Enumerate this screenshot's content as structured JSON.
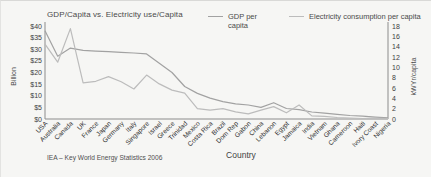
{
  "title": "GDP/Capita vs. Electricity use/Capita",
  "legend": {
    "gdp_label": "GDP per capita",
    "electricity_label": "Electricity consumption per capita"
  },
  "left_axis": {
    "title": "Billion",
    "max": 40,
    "step": 5,
    "ticks": [
      "$40",
      "$35",
      "$30",
      "$25",
      "$20",
      "$15",
      "$10",
      "$5",
      "$0"
    ]
  },
  "right_axis": {
    "title": "kWYr/capita",
    "max": 18,
    "step": 2,
    "ticks": [
      "18",
      "16",
      "14",
      "12",
      "10",
      "8",
      "6",
      "4",
      "2",
      "0"
    ]
  },
  "x_axis": {
    "title": "Country"
  },
  "source_note": "IEA – Key World Energy Statistics 2006",
  "colors": {
    "gdp_line": "#a2a2a2",
    "electricity_line": "#bcbcbc",
    "axis": "#8c8c8c"
  },
  "chart_data": {
    "type": "line",
    "title": "GDP/Capita vs. Electricity use/Capita",
    "xlabel": "Country",
    "ylabel_left": "Billion",
    "ylabel_right": "kWYr/capita",
    "left_ylim": [
      0,
      40
    ],
    "right_ylim": [
      0,
      18
    ],
    "grid": false,
    "legend_position": "top",
    "categories": [
      "USA",
      "Australia",
      "Canada",
      "UK",
      "France",
      "Japan",
      "Germany",
      "Italy",
      "Singapore",
      "Israel",
      "Greece",
      "Trinidad",
      "Mexico",
      "Costa Rica",
      "Brazil",
      "Dom Rep",
      "Gabon",
      "China",
      "Lebanon",
      "Egypt",
      "Jamaica",
      "India",
      "Vietnam",
      "Ghana",
      "Cameroon",
      "Haiti",
      "Ivory Coast",
      "Nigeria"
    ],
    "series": [
      {
        "name": "GDP per capita",
        "axis": "left",
        "color": "#a2a2a2",
        "values": [
          38,
          27,
          30.5,
          29.5,
          29.2,
          29,
          28.7,
          28.4,
          28,
          24,
          20,
          14,
          11,
          9,
          7.5,
          6.5,
          6,
          5,
          7,
          4.5,
          4,
          3,
          2.5,
          2,
          1.5,
          1.2,
          0.8,
          0.5
        ]
      },
      {
        "name": "Electricity consumption per capita",
        "axis": "right",
        "color": "#bcbcbc",
        "values": [
          14.5,
          11,
          17.5,
          7,
          7.3,
          8.2,
          7.2,
          5.8,
          8.5,
          6.8,
          5.6,
          5,
          2,
          1.7,
          2,
          1.4,
          1,
          1.7,
          2.4,
          1.2,
          2.7,
          0.6,
          0.5,
          0.3,
          0.2,
          0.1,
          0.2,
          0.1
        ]
      }
    ]
  }
}
